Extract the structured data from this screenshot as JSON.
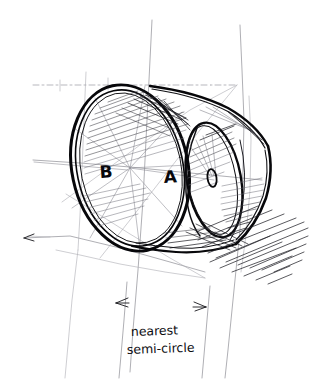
{
  "drawing": {
    "title": "Perspective cylinder construction sketch",
    "medium": "pen-and-ink freehand sketch",
    "background_color": "#ffffff",
    "ink_color": "#101014",
    "construction_line_color": "#8d8d93",
    "shadow_color": "#23232a"
  },
  "labels": {
    "near_center": "B",
    "far_center": "A"
  },
  "annotation": {
    "line1": "nearest",
    "line2": "semi-circle"
  },
  "parts": {
    "near_rim": "near-ellipse-rim",
    "far_rim": "far-ellipse-rim",
    "body": "cylinder-body",
    "shadow": "cast-shadow",
    "center_mark": "far-center-ellipse-mark"
  },
  "dimension": {
    "left_arrow": "arrow-left",
    "right_arrow": "arrow-right",
    "extension_left_x": 118,
    "extension_right_x": 204
  },
  "geometry": {
    "near_ellipse": {
      "cx": 130,
      "cy": 168,
      "rx": 58,
      "ry": 84,
      "rotation_deg": -12
    },
    "far_ellipse": {
      "cx": 214,
      "cy": 180,
      "rx": 27,
      "ry": 58,
      "rotation_deg": -10
    },
    "vanishing_point_upper": {
      "x": 237,
      "y": 85
    },
    "vanishing_point_lower": {
      "x": 205,
      "y": 278
    }
  }
}
